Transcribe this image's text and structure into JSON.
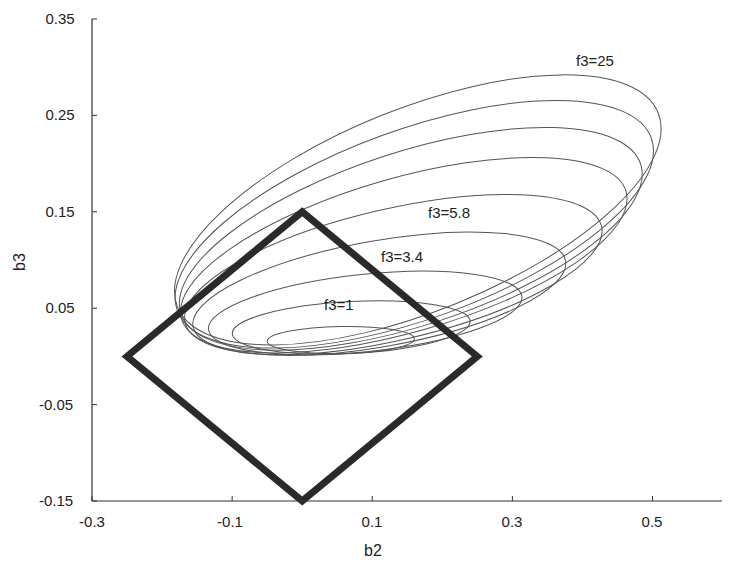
{
  "chart_data": {
    "type": "contour",
    "title": "",
    "xlabel": "b2",
    "ylabel": "b3",
    "xlim": [
      -0.3,
      0.6
    ],
    "ylim": [
      -0.15,
      0.35
    ],
    "x_ticks": [
      "-0.3",
      "-0.1",
      "0.1",
      "0.3",
      "0.5"
    ],
    "x_tick_values": [
      -0.3,
      -0.1,
      0.1,
      0.3,
      0.5
    ],
    "y_ticks": [
      "0.35",
      "0.25",
      "0.15",
      "0.05",
      "-0.05",
      "-0.15"
    ],
    "y_tick_values": [
      0.35,
      0.25,
      0.15,
      0.05,
      -0.05,
      -0.15
    ],
    "grid": false,
    "constraint_region": {
      "shape": "diamond (L1 ball)",
      "vertices": [
        [
          -0.25,
          0.0
        ],
        [
          0.0,
          0.15
        ],
        [
          0.25,
          0.0
        ],
        [
          0.0,
          -0.15
        ]
      ]
    },
    "contours": [
      {
        "level": "1",
        "label": "f3=1",
        "cx": 0.055,
        "cy": 0.017,
        "rx": 0.105,
        "ry": 0.014,
        "angle": -1
      },
      {
        "level": "",
        "label": "",
        "cx": 0.07,
        "cy": 0.03,
        "rx": 0.17,
        "ry": 0.027,
        "angle": -3
      },
      {
        "level": "3.4",
        "label": "f3=3.4",
        "cx": 0.09,
        "cy": 0.045,
        "rx": 0.225,
        "ry": 0.04,
        "angle": -6
      },
      {
        "level": "",
        "label": "",
        "cx": 0.11,
        "cy": 0.065,
        "rx": 0.27,
        "ry": 0.055,
        "angle": -10
      },
      {
        "level": "5.8",
        "label": "f3=5.8",
        "cx": 0.13,
        "cy": 0.085,
        "rx": 0.305,
        "ry": 0.068,
        "angle": -13
      },
      {
        "level": "",
        "label": "",
        "cx": 0.145,
        "cy": 0.105,
        "rx": 0.33,
        "ry": 0.08,
        "angle": -16
      },
      {
        "level": "",
        "label": "",
        "cx": 0.155,
        "cy": 0.122,
        "rx": 0.345,
        "ry": 0.09,
        "angle": -18
      },
      {
        "level": "",
        "label": "",
        "cx": 0.16,
        "cy": 0.137,
        "rx": 0.36,
        "ry": 0.098,
        "angle": -20
      },
      {
        "level": "25",
        "label": "f3=25",
        "cx": 0.165,
        "cy": 0.152,
        "rx": 0.37,
        "ry": 0.105,
        "angle": -22
      }
    ],
    "annotations": [
      {
        "text": "f3=25",
        "x": 0.42,
        "y": 0.33
      },
      {
        "text": "f3=5.8",
        "x": 0.19,
        "y": 0.15
      },
      {
        "text": "f3=3.4",
        "x": 0.13,
        "y": 0.105
      },
      {
        "text": "f3=1",
        "x": 0.04,
        "y": 0.053
      }
    ]
  },
  "labels": {
    "xlabel": "b2",
    "ylabel": "b3",
    "annot_f25": "f3=25",
    "annot_f58": "f3=5.8",
    "annot_f34": "f3=3.4",
    "annot_f1": "f3=1",
    "xt0": "-0.3",
    "xt1": "-0.1",
    "xt2": "0.1",
    "xt3": "0.3",
    "xt4": "0.5",
    "yt0": "0.35",
    "yt1": "0.25",
    "yt2": "0.15",
    "yt3": "0.05",
    "yt4": "-0.05",
    "yt5": "-0.15"
  }
}
